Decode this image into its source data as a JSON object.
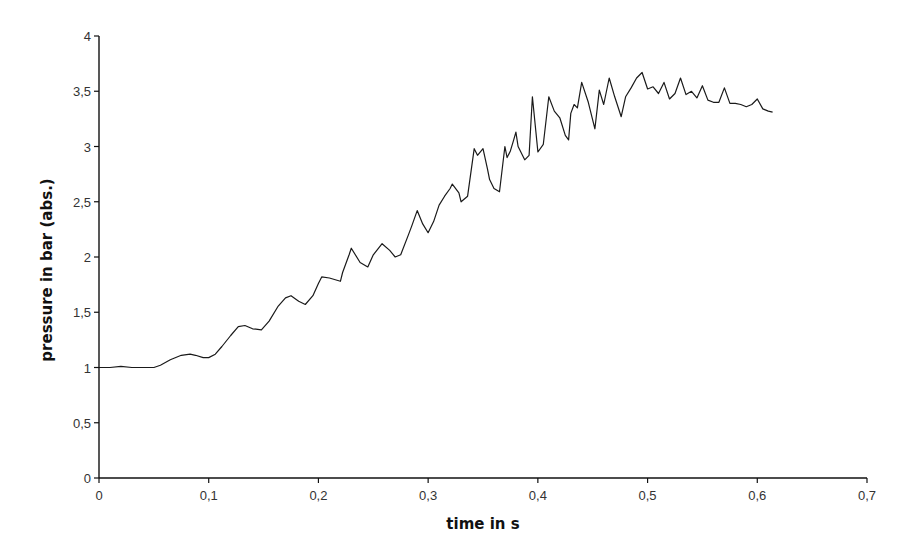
{
  "chart_data": {
    "type": "line",
    "title": "",
    "xlabel": "time in s",
    "ylabel": "pressure in bar (abs.)",
    "xlim": [
      0,
      0.7
    ],
    "ylim": [
      0,
      4
    ],
    "grid": false,
    "legend": null,
    "x_ticks": [
      0,
      0.1,
      0.2,
      0.3,
      0.4,
      0.5,
      0.6,
      0.7
    ],
    "x_tick_labels": [
      "0",
      "0,1",
      "0,2",
      "0,3",
      "0,4",
      "0,5",
      "0,6",
      "0,7"
    ],
    "y_ticks": [
      0,
      0.5,
      1,
      1.5,
      2,
      2.5,
      3,
      3.5,
      4
    ],
    "y_tick_labels": [
      "0",
      "0,5",
      "1",
      "1,5",
      "2",
      "2,5",
      "3",
      "3,5",
      "4"
    ],
    "series": [
      {
        "name": "pressure",
        "color": "#1a1a1a",
        "x": [
          0.0,
          0.01,
          0.02,
          0.03,
          0.04,
          0.05,
          0.056,
          0.065,
          0.075,
          0.083,
          0.088,
          0.095,
          0.1,
          0.106,
          0.112,
          0.12,
          0.127,
          0.133,
          0.14,
          0.148,
          0.155,
          0.163,
          0.17,
          0.175,
          0.182,
          0.188,
          0.195,
          0.2,
          0.203,
          0.21,
          0.22,
          0.222,
          0.228,
          0.23,
          0.238,
          0.245,
          0.25,
          0.258,
          0.265,
          0.27,
          0.275,
          0.282,
          0.285,
          0.29,
          0.295,
          0.3,
          0.305,
          0.31,
          0.315,
          0.32,
          0.322,
          0.328,
          0.33,
          0.336,
          0.342,
          0.345,
          0.35,
          0.354,
          0.356,
          0.36,
          0.365,
          0.37,
          0.372,
          0.375,
          0.378,
          0.38,
          0.382,
          0.388,
          0.392,
          0.395,
          0.4,
          0.405,
          0.41,
          0.415,
          0.42,
          0.425,
          0.428,
          0.43,
          0.433,
          0.436,
          0.44,
          0.446,
          0.452,
          0.456,
          0.46,
          0.465,
          0.47,
          0.476,
          0.48,
          0.485,
          0.49,
          0.495,
          0.5,
          0.505,
          0.51,
          0.515,
          0.52,
          0.525,
          0.53,
          0.535,
          0.54,
          0.545,
          0.55,
          0.555,
          0.56,
          0.565,
          0.57,
          0.575,
          0.58,
          0.585,
          0.59,
          0.595,
          0.6,
          0.605,
          0.61,
          0.614
        ],
        "y": [
          1.0,
          1.0,
          1.01,
          1.0,
          1.0,
          1.0,
          1.02,
          1.07,
          1.11,
          1.12,
          1.11,
          1.09,
          1.09,
          1.12,
          1.19,
          1.29,
          1.37,
          1.38,
          1.35,
          1.34,
          1.42,
          1.55,
          1.63,
          1.65,
          1.6,
          1.57,
          1.65,
          1.76,
          1.82,
          1.81,
          1.78,
          1.86,
          2.02,
          2.08,
          1.95,
          1.91,
          2.02,
          2.12,
          2.06,
          2.0,
          2.02,
          2.2,
          2.28,
          2.42,
          2.3,
          2.22,
          2.32,
          2.47,
          2.55,
          2.62,
          2.66,
          2.58,
          2.5,
          2.55,
          2.98,
          2.92,
          2.98,
          2.8,
          2.7,
          2.62,
          2.59,
          3.0,
          2.9,
          2.96,
          3.06,
          3.13,
          3.0,
          2.88,
          2.92,
          3.45,
          2.95,
          3.02,
          3.45,
          3.32,
          3.26,
          3.1,
          3.06,
          3.3,
          3.38,
          3.35,
          3.58,
          3.4,
          3.16,
          3.51,
          3.38,
          3.62,
          3.45,
          3.27,
          3.45,
          3.53,
          3.62,
          3.67,
          3.52,
          3.54,
          3.48,
          3.58,
          3.43,
          3.48,
          3.62,
          3.47,
          3.5,
          3.44,
          3.55,
          3.42,
          3.4,
          3.4,
          3.53,
          3.39,
          3.39,
          3.38,
          3.36,
          3.38,
          3.43,
          3.34,
          3.32,
          3.31
        ]
      }
    ],
    "annotations": []
  },
  "axes": {
    "x_title": "time in s",
    "y_title": "pressure in bar (abs.)"
  }
}
